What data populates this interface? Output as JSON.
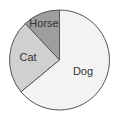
{
  "chart_data": {
    "type": "pie",
    "title": "",
    "categories": [
      "Horse",
      "Cat",
      "Dog"
    ],
    "values": [
      12,
      24,
      64
    ],
    "start_angle_deg": 0,
    "direction": "counterclockwise",
    "colors": [
      "#9e9e9e",
      "#d0d0d0",
      "#f3f3f3"
    ],
    "outline_color": "#555555",
    "legend": "none",
    "labels_inside": true
  },
  "labels": {
    "horse": "Horse",
    "cat": "Cat",
    "dog": "Dog"
  }
}
